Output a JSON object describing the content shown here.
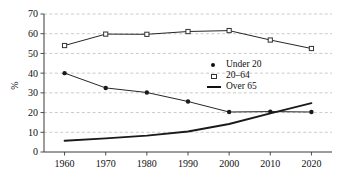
{
  "chart_data": {
    "type": "line",
    "title": "",
    "xlabel": "",
    "ylabel": "%",
    "x": [
      1960,
      1970,
      1980,
      1990,
      2000,
      2010,
      2020
    ],
    "xticklabels": [
      "1960",
      "1970",
      "1980",
      "1990",
      "2000",
      "2010",
      "2020"
    ],
    "yticklabels": [
      "0",
      "10",
      "20",
      "30",
      "40",
      "50",
      "60",
      "70"
    ],
    "ylim": [
      0,
      70
    ],
    "xlim": [
      1955,
      2025
    ],
    "ytick_step": 10,
    "grid": "horizontal-dashed",
    "legend_position": "center-right",
    "series": [
      {
        "name": "Under 20",
        "marker": "filled-circle",
        "values": [
          40.0,
          32.5,
          30.2,
          25.6,
          20.3,
          20.5,
          20.3
        ]
      },
      {
        "name": "20–64",
        "marker": "open-square",
        "values": [
          54.0,
          59.8,
          59.7,
          61.1,
          61.6,
          56.8,
          52.5
        ]
      },
      {
        "name": "Over 65",
        "marker": "line-only",
        "values": [
          5.7,
          6.9,
          8.3,
          10.4,
          14.2,
          19.6,
          24.8
        ]
      }
    ]
  },
  "legend": {
    "entries": [
      {
        "label": "Under 20",
        "icon": "filled-circle-marker"
      },
      {
        "label": "20–64",
        "icon": "open-square-marker"
      },
      {
        "label": "Over 65",
        "icon": "solid-line-marker"
      }
    ]
  },
  "colors": {
    "axis": "#3b3b3b",
    "grid": "#bdbdbd",
    "series_line": "#1a1a1a",
    "background": "#ffffff"
  }
}
